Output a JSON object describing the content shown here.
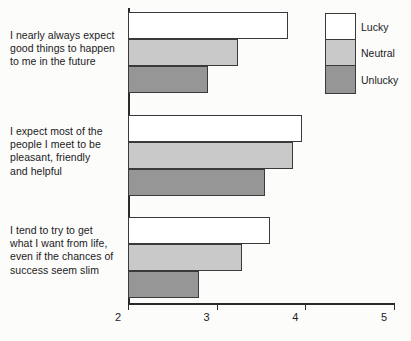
{
  "chart_data": {
    "type": "bar",
    "orientation": "horizontal",
    "title": "",
    "xlabel": "",
    "ylabel": "",
    "xlim": [
      2,
      5
    ],
    "xticks": [
      "2",
      "3",
      "4",
      "5"
    ],
    "grid": false,
    "legend_position": "top-right",
    "categories": [
      "I nearly always expect good things to happen to me in the future",
      "I expect most of the people I meet to be pleasant, friendly and helpful",
      "I tend to try to get what I want from life, even if the chances of success seem slim"
    ],
    "series": [
      {
        "name": "Lucky",
        "color": "#ffffff",
        "values": [
          3.8,
          3.96,
          3.6
        ]
      },
      {
        "name": "Neutral",
        "color": "#c9c9c9",
        "values": [
          3.24,
          3.86,
          3.29
        ]
      },
      {
        "name": "Unlucky",
        "color": "#969696",
        "values": [
          2.9,
          3.54,
          2.8
        ]
      }
    ]
  },
  "category_labels": [
    {
      "lines": [
        "I nearly always expect",
        "good things to happen",
        "to me in the future"
      ]
    },
    {
      "lines": [
        "I expect most of the",
        "people I meet to be",
        "pleasant, friendly",
        "and helpful"
      ]
    },
    {
      "lines": [
        "I tend to try to get",
        "what I want from life,",
        "even if the chances of",
        "success seem slim"
      ]
    }
  ],
  "axis": {
    "ticks": [
      {
        "label": "2",
        "value": 2
      },
      {
        "label": "3",
        "value": 3
      },
      {
        "label": "4",
        "value": 4
      },
      {
        "label": "5",
        "value": 5
      }
    ]
  },
  "legend": {
    "entries": [
      {
        "label": "Lucky",
        "color": "#ffffff"
      },
      {
        "label": "Neutral",
        "color": "#c9c9c9"
      },
      {
        "label": "Unlucky",
        "color": "#969696"
      }
    ]
  }
}
